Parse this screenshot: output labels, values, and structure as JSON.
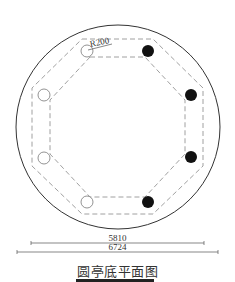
{
  "drawing": {
    "title": "圆亭底平面图",
    "radius_label": "R200",
    "dimensions": {
      "inner": "5810",
      "outer": "6724"
    },
    "outer_circle": {
      "cx": 118,
      "cy": 127,
      "r": 102
    },
    "octagon_outer": [
      [
        78,
        40
      ],
      [
        157,
        40
      ],
      [
        203,
        87
      ],
      [
        203,
        165
      ],
      [
        157,
        212
      ],
      [
        78,
        212
      ],
      [
        32,
        165
      ],
      [
        32,
        87
      ]
    ],
    "octagon_inner": [
      [
        92,
        56
      ],
      [
        143,
        56
      ],
      [
        185,
        98
      ],
      [
        185,
        154
      ],
      [
        143,
        196
      ],
      [
        92,
        196
      ],
      [
        50,
        154
      ],
      [
        50,
        98
      ]
    ],
    "columns": [
      {
        "position": "top-left",
        "cx": 87,
        "cy": 51,
        "filled": false
      },
      {
        "position": "top-right",
        "cx": 148,
        "cy": 51,
        "filled": true
      },
      {
        "position": "right-upper",
        "cx": 191,
        "cy": 95,
        "filled": true
      },
      {
        "position": "right-lower",
        "cx": 191,
        "cy": 157,
        "filled": true
      },
      {
        "position": "bottom-right",
        "cx": 148,
        "cy": 202,
        "filled": true
      },
      {
        "position": "bottom-left",
        "cx": 87,
        "cy": 202,
        "filled": false
      },
      {
        "position": "left-lower",
        "cx": 44,
        "cy": 158,
        "filled": false
      },
      {
        "position": "left-upper",
        "cx": 44,
        "cy": 95,
        "filled": false
      }
    ],
    "colors": {
      "line": "#333333",
      "dashed": "#888888",
      "fill": "#111111"
    }
  }
}
